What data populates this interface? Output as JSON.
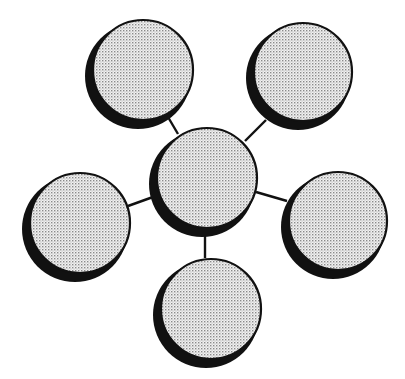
{
  "diagram": {
    "type": "hub-and-spoke",
    "background": "#ffffff",
    "stroke_color": "#111111",
    "shadow_color": "#111111",
    "fill_pattern": "dotted-gray",
    "pattern_dot_color": "#8a8a8a",
    "pattern_bg_color": "#f2f2f2",
    "hub": {
      "id": "center",
      "cx": 205,
      "cy": 180,
      "r": 53
    },
    "nodes": [
      {
        "id": "top-left",
        "cx": 141,
        "cy": 72,
        "r": 53
      },
      {
        "id": "top-right",
        "cx": 301,
        "cy": 74,
        "r": 52
      },
      {
        "id": "left",
        "cx": 78,
        "cy": 225,
        "r": 53
      },
      {
        "id": "right",
        "cx": 336,
        "cy": 223,
        "r": 52
      },
      {
        "id": "bottom",
        "cx": 209,
        "cy": 311,
        "r": 53
      }
    ],
    "connectors": [
      {
        "from": "center",
        "to": "top-left",
        "x1": 178,
        "y1": 134,
        "x2": 168,
        "y2": 117
      },
      {
        "from": "center",
        "to": "top-right",
        "x1": 245,
        "y1": 141,
        "x2": 266,
        "y2": 120
      },
      {
        "from": "center",
        "to": "left",
        "x1": 153,
        "y1": 197,
        "x2": 128,
        "y2": 206
      },
      {
        "from": "center",
        "to": "right",
        "x1": 256,
        "y1": 192,
        "x2": 287,
        "y2": 201
      },
      {
        "from": "center",
        "to": "bottom",
        "x1": 205,
        "y1": 233,
        "x2": 205,
        "y2": 258
      }
    ],
    "labels": []
  }
}
